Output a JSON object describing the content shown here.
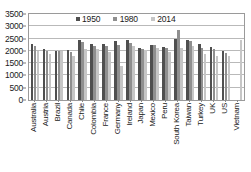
{
  "chart_data": {
    "type": "bar",
    "title": "",
    "xlabel": "",
    "ylabel": "",
    "ylim": [
      0,
      3500
    ],
    "ytick_step": 500,
    "yticks": [
      3500,
      3000,
      2500,
      2000,
      1500,
      1000,
      500,
      0
    ],
    "grid": true,
    "legend_position": "top-center",
    "categories": [
      "Australia",
      "Austria",
      "Brazil",
      "Canada",
      "Chile",
      "Colombia",
      "France",
      "Germany",
      "Ireland",
      "Japan",
      "Mexico",
      "Peru",
      "South Korea",
      "Taiwan",
      "Turkey",
      "UK",
      "US",
      "Vietnam"
    ],
    "series": [
      {
        "name": "1950",
        "color": "#4f4f4f",
        "values": [
          2280,
          2080,
          2010,
          2040,
          2460,
          2300,
          2300,
          2420,
          2460,
          2120,
          2220,
          2140,
          2500,
          2440,
          2290,
          2170,
          1980,
          null
        ]
      },
      {
        "name": "1980",
        "color": "#8f8f8f",
        "values": [
          2190,
          2000,
          2010,
          1960,
          2380,
          2180,
          2200,
          2230,
          2340,
          2090,
          2220,
          2100,
          2830,
          2420,
          2120,
          2060,
          1920,
          null
        ]
      },
      {
        "name": "2014",
        "color": "#c6c6c6",
        "values": [
          2010,
          1860,
          2010,
          1810,
          2090,
          2060,
          1950,
          1370,
          2180,
          2030,
          2110,
          1970,
          2120,
          2210,
          1870,
          1780,
          1790,
          2440
        ]
      }
    ]
  },
  "legend": {
    "items": [
      {
        "label": "1950",
        "color": "#4f4f4f",
        "marker": "square-marker"
      },
      {
        "label": "1980",
        "color": "#8f8f8f",
        "marker": "square-marker"
      },
      {
        "label": "2014",
        "color": "#c6c6c6",
        "marker": "square-marker"
      }
    ]
  },
  "footer": {
    "note": ""
  }
}
